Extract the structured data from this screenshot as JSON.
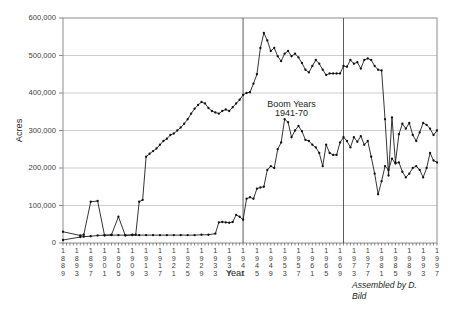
{
  "chart_data": {
    "type": "line",
    "title": "",
    "xlabel": "Year",
    "ylabel": "Acres",
    "ylim": [
      0,
      600000
    ],
    "xlim": [
      1889,
      1997
    ],
    "grid": true,
    "legend_position": "none",
    "ytick_labels": [
      "0",
      "100,000",
      "200,000",
      "300,000",
      "400,000",
      "500,000",
      "600,000"
    ],
    "ytick_values": [
      0,
      100000,
      200000,
      300000,
      400000,
      500000,
      600000
    ],
    "xtick_labels": [
      "1889",
      "1893",
      "1897",
      "1901",
      "1905",
      "1909",
      "1913",
      "1917",
      "1921",
      "1925",
      "1929",
      "1933",
      "1937",
      "1941",
      "1945",
      "1949",
      "1953",
      "1957",
      "1961",
      "1965",
      "1969",
      "1973",
      "1977",
      "1981",
      "1985",
      "1989",
      "1993",
      "1997"
    ],
    "xtick_values": [
      1889,
      1893,
      1897,
      1901,
      1905,
      1909,
      1913,
      1917,
      1921,
      1925,
      1929,
      1933,
      1937,
      1941,
      1945,
      1949,
      1953,
      1957,
      1961,
      1965,
      1969,
      1973,
      1977,
      1981,
      1985,
      1989,
      1993,
      1997
    ],
    "annotations": [
      {
        "text": "Boom Years",
        "x": 1955,
        "y": 362000
      },
      {
        "text": "1941-70",
        "x": 1955,
        "y": 338000
      }
    ],
    "vlines": [
      1941,
      1970
    ],
    "credit": "Assembled by D.\nBild",
    "credit_line1": "Assembled by D.",
    "credit_line2": "Bild",
    "series": [
      {
        "name": "upper-series",
        "x": [
          1889,
          1894,
          1895,
          1897,
          1899,
          1901,
          1903,
          1905,
          1907,
          1909,
          1910,
          1911,
          1912,
          1913,
          1914,
          1915,
          1916,
          1917,
          1918,
          1919,
          1920,
          1921,
          1922,
          1923,
          1924,
          1925,
          1926,
          1927,
          1928,
          1929,
          1930,
          1931,
          1932,
          1933,
          1934,
          1935,
          1936,
          1937,
          1938,
          1939,
          1940,
          1941,
          1942,
          1943,
          1944,
          1945,
          1946,
          1947,
          1948,
          1949,
          1950,
          1951,
          1952,
          1953,
          1954,
          1955,
          1956,
          1957,
          1958,
          1959,
          1960,
          1961,
          1962,
          1963,
          1964,
          1965,
          1966,
          1967,
          1968,
          1969,
          1970,
          1971,
          1972,
          1973,
          1974,
          1975,
          1976,
          1977,
          1978,
          1979,
          1980,
          1981,
          1982,
          1983,
          1984,
          1985,
          1986,
          1987,
          1988,
          1989,
          1990,
          1991,
          1992,
          1993,
          1994,
          1995,
          1996,
          1997
        ],
        "values": [
          30000,
          20000,
          22000,
          110000,
          112000,
          20000,
          22000,
          70000,
          20000,
          22000,
          22000,
          110000,
          115000,
          230000,
          238000,
          245000,
          252000,
          262000,
          272000,
          278000,
          288000,
          292000,
          300000,
          308000,
          318000,
          330000,
          345000,
          358000,
          368000,
          376000,
          372000,
          360000,
          352000,
          348000,
          345000,
          352000,
          356000,
          352000,
          362000,
          372000,
          382000,
          395000,
          400000,
          402000,
          425000,
          450000,
          520000,
          560000,
          540000,
          512000,
          520000,
          498000,
          485000,
          505000,
          512000,
          498000,
          505000,
          495000,
          480000,
          462000,
          455000,
          472000,
          488000,
          478000,
          462000,
          448000,
          452000,
          452000,
          452000,
          452000,
          472000,
          470000,
          488000,
          478000,
          482000,
          465000,
          488000,
          492000,
          488000,
          472000,
          462000,
          460000,
          330000,
          180000,
          335000,
          215000,
          290000,
          318000,
          305000,
          320000,
          288000,
          272000,
          295000,
          320000,
          315000,
          305000,
          288000,
          300000
        ]
      },
      {
        "name": "lower-series",
        "x": [
          1889,
          1894,
          1895,
          1897,
          1899,
          1901,
          1903,
          1905,
          1907,
          1909,
          1911,
          1913,
          1915,
          1917,
          1919,
          1921,
          1923,
          1925,
          1927,
          1929,
          1931,
          1933,
          1934,
          1935,
          1936,
          1937,
          1938,
          1939,
          1940,
          1941,
          1942,
          1943,
          1944,
          1945,
          1946,
          1947,
          1948,
          1949,
          1950,
          1951,
          1952,
          1953,
          1954,
          1955,
          1956,
          1957,
          1958,
          1959,
          1960,
          1961,
          1962,
          1963,
          1964,
          1965,
          1966,
          1967,
          1968,
          1969,
          1970,
          1971,
          1972,
          1973,
          1974,
          1975,
          1976,
          1977,
          1978,
          1979,
          1980,
          1981,
          1982,
          1983,
          1984,
          1985,
          1986,
          1987,
          1988,
          1989,
          1990,
          1991,
          1992,
          1993,
          1994,
          1995,
          1996,
          1997
        ],
        "values": [
          8000,
          16000,
          17000,
          18000,
          20000,
          21000,
          21000,
          21000,
          21000,
          21000,
          21000,
          21000,
          21000,
          21000,
          21000,
          21000,
          21000,
          21000,
          21000,
          22000,
          22000,
          25000,
          55000,
          56000,
          55000,
          54000,
          56000,
          75000,
          70000,
          62000,
          118000,
          122000,
          118000,
          145000,
          148000,
          150000,
          195000,
          205000,
          200000,
          250000,
          268000,
          330000,
          322000,
          282000,
          300000,
          312000,
          298000,
          275000,
          272000,
          262000,
          255000,
          240000,
          205000,
          262000,
          240000,
          235000,
          235000,
          268000,
          282000,
          272000,
          255000,
          282000,
          270000,
          285000,
          262000,
          272000,
          230000,
          185000,
          130000,
          165000,
          205000,
          195000,
          225000,
          212000,
          215000,
          190000,
          175000,
          185000,
          200000,
          205000,
          195000,
          175000,
          200000,
          240000,
          220000,
          215000
        ]
      }
    ]
  }
}
